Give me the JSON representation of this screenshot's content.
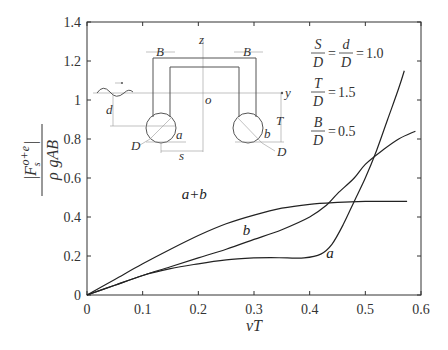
{
  "chart_data": {
    "type": "line",
    "title": "",
    "xlabel": "vT",
    "ylabel": "|F_s^{o+e}| / (ρ g A B)",
    "ylabel_parts": {
      "numerator": "|F",
      "sub": "s",
      "sup": "o+e",
      "bar": "|",
      "denominator_rho": "ρ",
      "denominator_rest": "gAB"
    },
    "xlim": [
      0,
      0.6
    ],
    "ylim": [
      0,
      1.4
    ],
    "x_ticks": [
      0,
      0.1,
      0.2,
      0.3,
      0.4,
      0.5,
      0.6
    ],
    "x_tick_labels": [
      "0",
      "0.1",
      "0.2",
      "0.3",
      "0.4",
      "0.5",
      "0.6"
    ],
    "y_ticks": [
      0,
      0.2,
      0.4,
      0.6,
      0.8,
      1.0,
      1.2,
      1.4
    ],
    "y_tick_labels": [
      "0",
      "0.2",
      "0.4",
      "0.6",
      "0.8",
      "1",
      "1.2",
      "1.4"
    ],
    "grid": false,
    "legend": "inline labels",
    "series": [
      {
        "name": "a+b",
        "label_pos": [
          0.17,
          0.49
        ],
        "x": [
          0,
          0.05,
          0.1,
          0.15,
          0.2,
          0.25,
          0.3,
          0.35,
          0.4,
          0.45,
          0.5,
          0.55,
          0.575
        ],
        "y": [
          0,
          0.08,
          0.16,
          0.235,
          0.305,
          0.365,
          0.41,
          0.445,
          0.465,
          0.475,
          0.48,
          0.48,
          0.48
        ]
      },
      {
        "name": "b",
        "label_pos": [
          0.28,
          0.31
        ],
        "x": [
          0,
          0.05,
          0.1,
          0.15,
          0.2,
          0.25,
          0.3,
          0.35,
          0.4,
          0.43,
          0.45,
          0.48,
          0.5,
          0.53,
          0.56,
          0.59
        ],
        "y": [
          0,
          0.05,
          0.1,
          0.145,
          0.19,
          0.235,
          0.285,
          0.335,
          0.4,
          0.46,
          0.52,
          0.6,
          0.67,
          0.74,
          0.8,
          0.84
        ]
      },
      {
        "name": "a",
        "label_pos": [
          0.43,
          0.19
        ],
        "x": [
          0,
          0.05,
          0.1,
          0.15,
          0.2,
          0.25,
          0.3,
          0.33,
          0.36,
          0.39,
          0.42,
          0.44,
          0.46,
          0.48,
          0.5,
          0.52,
          0.54,
          0.56,
          0.57
        ],
        "y": [
          0,
          0.05,
          0.1,
          0.135,
          0.16,
          0.18,
          0.19,
          0.192,
          0.19,
          0.19,
          0.21,
          0.26,
          0.36,
          0.48,
          0.6,
          0.74,
          0.9,
          1.06,
          1.15
        ]
      }
    ],
    "annotations": {
      "parameters": [
        {
          "lhs_num": "S",
          "lhs_den": "D",
          "mid_num": "d",
          "mid_den": "D",
          "value": "1.0"
        },
        {
          "lhs_num": "T",
          "lhs_den": "D",
          "value": "1.5"
        },
        {
          "lhs_num": "B",
          "lhs_den": "D",
          "value": "0.5"
        }
      ],
      "inset_labels": {
        "B_left": "B",
        "B_right": "B",
        "z": "z",
        "y": "y",
        "o": "o",
        "d": "d",
        "T": "T",
        "a": "a",
        "b": "b",
        "D_left": "D",
        "D_right": "D",
        "s": "s"
      }
    }
  }
}
